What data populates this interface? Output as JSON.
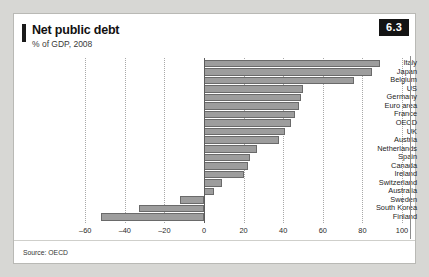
{
  "figure": {
    "title": "Net public debt",
    "subtitle": "% of GDP, 2008",
    "badge": "6.3",
    "source": "Source: OECD"
  },
  "chart_data": {
    "type": "bar",
    "orientation": "horizontal",
    "title": "Net public debt",
    "subtitle": "% of GDP, 2008",
    "xlabel": "",
    "ylabel": "",
    "xlim": [
      -60,
      100
    ],
    "ticks": [
      -60,
      -40,
      -20,
      0,
      20,
      40,
      60,
      80,
      100
    ],
    "tick_labels": [
      "–60",
      "–40",
      "–20",
      "0",
      "20",
      "40",
      "60",
      "80",
      "100"
    ],
    "grid": true,
    "legend": false,
    "categories": [
      "Italy",
      "Japan",
      "Belgium",
      "US",
      "Germany",
      "Euro area",
      "France",
      "OECD",
      "UK",
      "Austria",
      "Netherlands",
      "Spain",
      "Canada",
      "Ireland",
      "Switzerland",
      "Australia",
      "Sweden",
      "South Korea",
      "Finland"
    ],
    "values": [
      89,
      85,
      76,
      50,
      49,
      48,
      46,
      44,
      41,
      38,
      27,
      23,
      22,
      20,
      9,
      5,
      -12,
      -33,
      -52
    ],
    "bar_fill": "#9d9d9d",
    "bar_stroke": "#6a6a6a"
  }
}
